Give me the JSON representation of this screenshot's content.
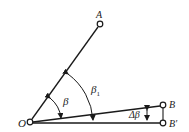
{
  "diagram": {
    "points": {
      "O": {
        "label": "O",
        "x": 30,
        "y": 122
      },
      "A": {
        "label": "A",
        "x": 100,
        "y": 24
      },
      "B": {
        "label": "B",
        "x": 163,
        "y": 105
      },
      "B_prime": {
        "label": "B′",
        "x": 163,
        "y": 123
      }
    },
    "angles": {
      "beta": {
        "label": "β"
      },
      "beta1": {
        "label": "β",
        "subscript": "1"
      },
      "delta_beta": {
        "label": "Δβ"
      }
    },
    "colors": {
      "stroke": "#1a1a1a",
      "background": "#ffffff"
    }
  }
}
